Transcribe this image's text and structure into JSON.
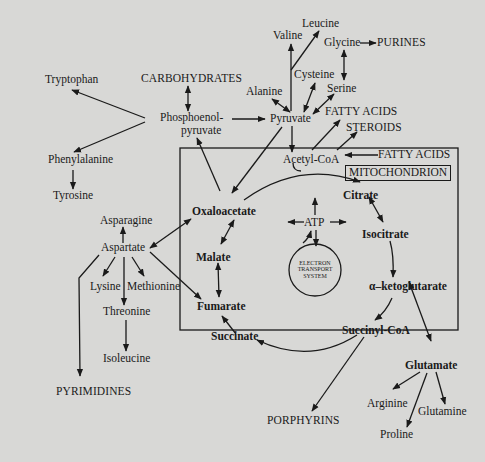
{
  "diagram": {
    "compartment_label": "MITOCHONDRION",
    "center_label": [
      "ELECTRON",
      "TRANSPORT",
      "SYSTEM"
    ],
    "nodes": {
      "tryptophan": "Tryptophan",
      "carbohydrates": "CARBOHYDRATES",
      "phosphoenolpyruvate_1": "Phosphoenol-",
      "phosphoenolpyruvate_2": "pyruvate",
      "phenylalanine": "Phenylalanine",
      "tyrosine": "Tyrosine",
      "leucine": "Leucine",
      "valine": "Valine",
      "glycine": "Glycine",
      "purines": "PURINES",
      "cysteine": "Cysteine",
      "serine": "Serine",
      "alanine": "Alanine",
      "pyruvate": "Pyruvate",
      "fatty_acids_out": "FATTY ACIDS",
      "steroids": "STEROIDS",
      "acetyl_coa": "Acetyl-CoA",
      "fatty_acids_in": "FATTY ACIDS",
      "citrate": "Citrate",
      "isocitrate": "Isocitrate",
      "alpha_ketoglutarate": "α–ketoglutarate",
      "succinyl_coa": "Succinyl-CoA",
      "succinate": "Succinate",
      "fumarate": "Fumarate",
      "malate": "Malate",
      "oxaloacetate": "Oxaloacetate",
      "atp": "ATP",
      "asparagine": "Asparagine",
      "aspartate": "Aspartate",
      "lysine": "Lysine",
      "methionine": "Methionine",
      "threonine": "Threonine",
      "isoleucine": "Isoleucine",
      "pyrimidines": "PYRIMIDINES",
      "porphyrins": "PORPHYRINS",
      "glutamate": "Glutamate",
      "arginine": "Arginine",
      "glutamine": "Glutamine",
      "proline": "Proline"
    },
    "colors": {
      "background": "#d8d8d6",
      "ink": "#1a1a1a"
    }
  }
}
